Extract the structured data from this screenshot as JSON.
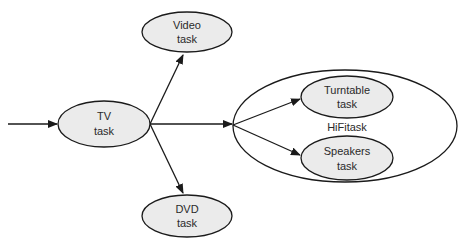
{
  "diagram": {
    "type": "task-hierarchy",
    "nodes": [
      {
        "id": "tv",
        "line1": "TV",
        "line2": "task"
      },
      {
        "id": "video",
        "line1": "Video",
        "line2": "task"
      },
      {
        "id": "dvd",
        "line1": "DVD",
        "line2": "task"
      },
      {
        "id": "turntable",
        "line1": "Turntable",
        "line2": "task"
      },
      {
        "id": "speakers",
        "line1": "Speakers",
        "line2": "task"
      }
    ],
    "container": {
      "id": "hifi",
      "label": "HiFitask"
    },
    "edges": [
      {
        "from": "external-input",
        "to": "tv"
      },
      {
        "from": "tv",
        "to": "video"
      },
      {
        "from": "tv",
        "to": "dvd"
      },
      {
        "from": "tv",
        "to": "hifi"
      },
      {
        "from": "hifi",
        "to": "turntable"
      },
      {
        "from": "hifi",
        "to": "speakers"
      }
    ]
  }
}
